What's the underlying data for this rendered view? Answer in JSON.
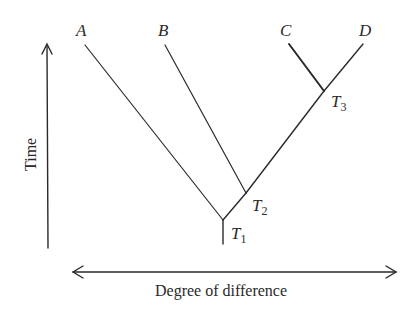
{
  "diagram": {
    "type": "phylogenetic-tree",
    "leaves": [
      {
        "id": "A",
        "label": "A"
      },
      {
        "id": "B",
        "label": "B"
      },
      {
        "id": "C",
        "label": "C"
      },
      {
        "id": "D",
        "label": "D"
      }
    ],
    "nodes": [
      {
        "id": "T1",
        "label": "T",
        "subscript": "1",
        "children": [
          "A",
          "T2"
        ]
      },
      {
        "id": "T2",
        "label": "T",
        "subscript": "2",
        "children": [
          "B",
          "T3"
        ]
      },
      {
        "id": "T3",
        "label": "T",
        "subscript": "3",
        "children": [
          "C",
          "D"
        ]
      }
    ],
    "axes": {
      "vertical": {
        "label": "Time",
        "direction": "up"
      },
      "horizontal": {
        "label": "Degree of difference",
        "direction": "both"
      }
    },
    "colors": {
      "line": "#2a2a2a",
      "background": "#ffffff"
    }
  }
}
